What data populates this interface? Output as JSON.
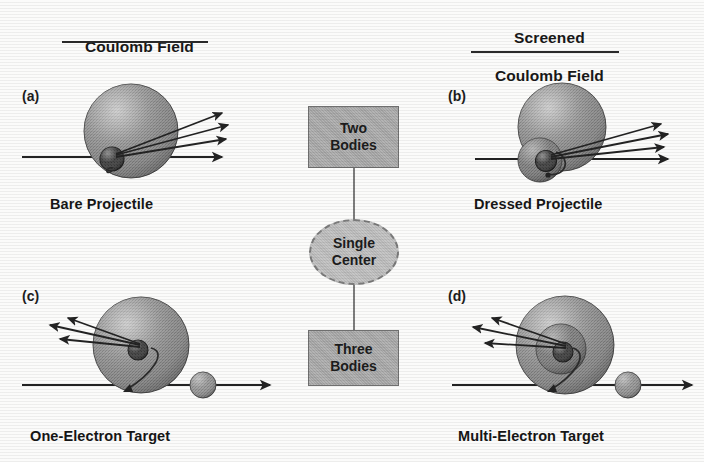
{
  "figure": {
    "headings": {
      "left": "Coulomb Field",
      "right_line1": "Screened",
      "right_line2": "Coulomb Field"
    },
    "panels": [
      {
        "id": "a",
        "label": "(a)",
        "caption": "Bare Projectile",
        "quadrant": "top-left",
        "description": "bare projectile scattering in a Coulomb field",
        "arrows_out": 3,
        "arrow_direction": "up-right",
        "beam_direction": "right",
        "shells": 0,
        "has_nucleus": true,
        "has_free_particle": false
      },
      {
        "id": "b",
        "label": "(b)",
        "caption": "Dressed Projectile",
        "quadrant": "top-right",
        "description": "dressed projectile scattering in a screened Coulomb field",
        "arrows_out": 3,
        "arrow_direction": "up-right",
        "beam_direction": "right",
        "shells": 1,
        "has_nucleus": true,
        "has_free_particle": false
      },
      {
        "id": "c",
        "label": "(c)",
        "caption": "One-Electron Target",
        "quadrant": "bottom-left",
        "description": "one-electron target struck by an incoming projectile",
        "arrows_out": 3,
        "arrow_direction": "up-left",
        "beam_direction": "right",
        "shells": 0,
        "has_nucleus": true,
        "has_free_particle": true
      },
      {
        "id": "d",
        "label": "(d)",
        "caption": "Multi-Electron Target",
        "quadrant": "bottom-right",
        "description": "multi-electron target struck by an incoming projectile",
        "arrows_out": 3,
        "arrow_direction": "up-left",
        "beam_direction": "right",
        "shells": 2,
        "has_nucleus": true,
        "has_free_particle": true
      }
    ],
    "flowchart": {
      "top_box": {
        "line1": "Two",
        "line2": "Bodies"
      },
      "middle_ellipse": {
        "line1": "Single",
        "line2": "Center"
      },
      "bottom_box": {
        "line1": "Three",
        "line2": "Bodies"
      }
    },
    "colors": {
      "sphere_fill": "#8f8f8f",
      "sphere_highlight": "#bcbcbc",
      "shell_fill": "#7e7e7e",
      "nucleus": "#3a3a3a",
      "flow_fill": "#ababab",
      "ellipse_fill": "#c0c0c0",
      "stroke": "#2a2a2a",
      "text": "#1b1b1b",
      "background": "#fbfbfa"
    }
  }
}
